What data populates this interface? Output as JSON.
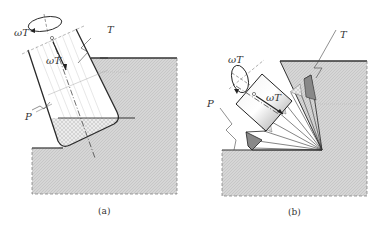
{
  "figure": {
    "panels": [
      {
        "id": "a",
        "caption": "(a)",
        "labels": {
          "omega_top": "ωT",
          "omega_axis": "ωT",
          "tool": "T",
          "part": "P"
        }
      },
      {
        "id": "b",
        "caption": "(b)",
        "labels": {
          "omega_top": "ωT",
          "omega_axis": "ωT",
          "tool": "T",
          "part": "P"
        }
      }
    ],
    "colors": {
      "workpiece_fill": "#d4d4d4",
      "outline": "#333333",
      "tool_fill": "#ffffff",
      "dark_insert": "#777777"
    }
  }
}
